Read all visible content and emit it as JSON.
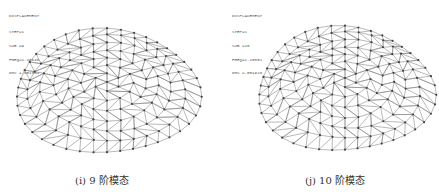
{
  "panels": [
    {
      "legend": {
        "title": "DISPLACEMENT",
        "step": "STEP=1",
        "sub": "SUB =9",
        "freq": "FREQ=1.10646",
        "dmx": "DMX =.001384"
      },
      "caption": "(i) 9 阶模态",
      "mode": 9
    },
    {
      "legend": {
        "title": "DISPLACEMENT",
        "step": "STEP=1",
        "sub": "SUB =10",
        "freq": "FREQ=1.10652",
        "dmx": "DMX =.001916"
      },
      "caption": "(j) 10 阶模态",
      "mode": 10
    }
  ],
  "colors": {
    "line": "#8a8a8a",
    "node": "#444444"
  }
}
